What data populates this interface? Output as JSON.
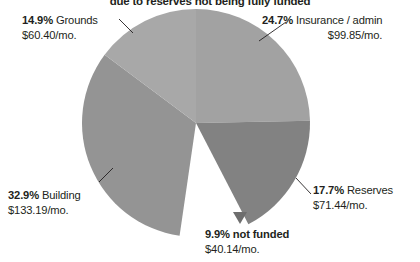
{
  "chart_data": {
    "type": "pie",
    "title": "due to reserves not being fully funded",
    "xlabel": "",
    "ylabel": "",
    "legend_position": "callout-labels",
    "grid": false,
    "categories": [
      "Insurance / admin",
      "Reserves",
      "not funded",
      "Building",
      "Grounds"
    ],
    "values": [
      24.7,
      17.7,
      9.9,
      32.9,
      14.9
    ],
    "value_unit": "%",
    "amounts": [
      "$99.85/mo.",
      "$71.44/mo.",
      "$40.14/mo.",
      "$133.19/mo.",
      "$60.40/mo."
    ],
    "slices": [
      {
        "name": "Insurance / admin",
        "percent_label": "24.7%",
        "percent": 24.7,
        "amount": "$99.85/mo.",
        "color": "#a2a2a2",
        "exploded": false,
        "start_angle": 0,
        "end_angle": 88.92
      },
      {
        "name": "Reserves",
        "percent_label": "17.7%",
        "percent": 17.7,
        "amount": "$71.44/mo.",
        "color": "#828282",
        "exploded": false,
        "start_angle": 88.92,
        "end_angle": 152.64
      },
      {
        "name": "not funded",
        "percent_label": "9.9%",
        "percent": 9.9,
        "amount": "$40.14/mo.",
        "color": "#ffffff",
        "exploded": true,
        "start_angle": 152.64,
        "end_angle": 188.28
      },
      {
        "name": "Building",
        "percent_label": "32.9%",
        "percent": 32.9,
        "amount": "$133.19/mo.",
        "color": "#949494",
        "exploded": false,
        "start_angle": 188.28,
        "end_angle": 306.72
      },
      {
        "name": "Grounds",
        "percent_label": "14.9%",
        "percent": 14.9,
        "amount": "$60.40/mo.",
        "color": "#a8a8a8",
        "exploded": false,
        "start_angle": 306.72,
        "end_angle": 360
      }
    ]
  },
  "labels": {
    "grounds": {
      "pct": "14.9%",
      "name": " Grounds",
      "amount": "$60.40/mo."
    },
    "insurance": {
      "pct": "24.7%",
      "name": " Insurance / admin",
      "amount": "$99.85/mo."
    },
    "building": {
      "pct": "32.9%",
      "name": " Building",
      "amount": "$133.19/mo."
    },
    "reserves": {
      "pct": "17.7%",
      "name": " Reserves",
      "amount": "$71.44/mo."
    },
    "notfunded": {
      "pct": "9.9%",
      "name": " not funded",
      "amount": "$40.14/mo."
    }
  }
}
